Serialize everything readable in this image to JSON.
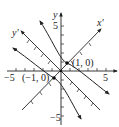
{
  "diagram": {
    "type": "rotated-axes hyperbola",
    "axes": {
      "x_label": "",
      "y_label": "y",
      "x_prime_label": "x′",
      "y_prime_label": "y′",
      "x_ticks": {
        "neg_label": "−5",
        "pos_label": "5"
      },
      "y_ticks": {
        "pos_label": "5",
        "neg_label": "−5"
      }
    },
    "points": [
      {
        "label": "(1, 0)",
        "x": 1,
        "y": 0
      },
      {
        "label": "(−1, 0)",
        "x": -1,
        "y": 0
      }
    ],
    "colors": {
      "ink": "#222222",
      "background": "#ffffff"
    }
  }
}
